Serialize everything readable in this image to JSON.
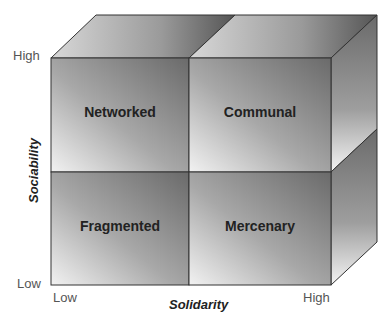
{
  "diagram": {
    "type": "2x2 cube matrix",
    "y_axis": {
      "label": "Sociability",
      "low": "Low",
      "high": "High"
    },
    "x_axis": {
      "label": "Solidarity",
      "low": "Low",
      "high": "High"
    },
    "quadrants": {
      "top_left": "Networked",
      "top_right": "Communal",
      "bottom_left": "Fragmented",
      "bottom_right": "Mercenary"
    }
  }
}
